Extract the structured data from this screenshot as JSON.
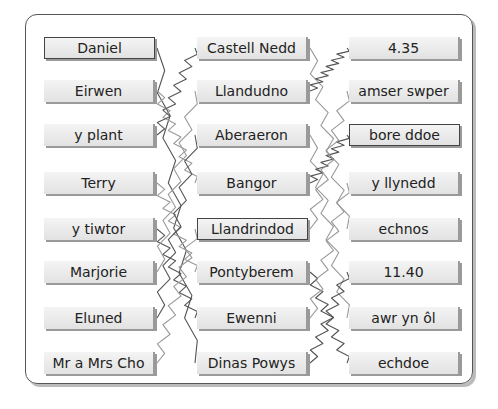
{
  "columns": {
    "names": [
      "Daniel",
      "Eirwen",
      "y plant",
      "Terry",
      "y tiwtor",
      "Marjorie",
      "Eluned",
      "Mr a Mrs Cho"
    ],
    "places": [
      "Castell Nedd",
      "Llandudno",
      "Aberaeron",
      "Bangor",
      "Llandrindod",
      "Pontyberem",
      "Ewenni",
      "Dinas Powys"
    ],
    "times": [
      "4.35",
      "amser swper",
      "bore ddoe",
      "y llynedd",
      "echnos",
      "11.40",
      "awr yn ôl",
      "echdoe"
    ]
  },
  "highlighted": {
    "names": 0,
    "places": 4,
    "times": 2
  },
  "colors": {
    "border": "#444444",
    "box_fill": "#ebebeb",
    "shadow": "#9a9a9a",
    "line": "#555555",
    "line_light": "#999999"
  }
}
